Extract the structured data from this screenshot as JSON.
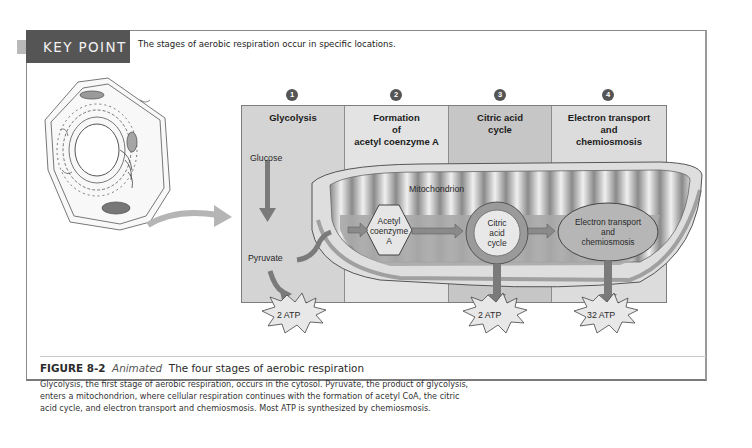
{
  "key_point": {
    "label": "KEY POINT",
    "text": "The stages of aerobic respiration occur in specific locations."
  },
  "diagram": {
    "stages": [
      {
        "number": "1",
        "title_lines": [
          "Glycolysis"
        ]
      },
      {
        "number": "2",
        "title_lines": [
          "Formation",
          "of",
          "acetyl coenzyme A"
        ]
      },
      {
        "number": "3",
        "title_lines": [
          "Citric acid",
          "cycle"
        ]
      },
      {
        "number": "4",
        "title_lines": [
          "Electron transport",
          "and",
          "chemiosmosis"
        ]
      }
    ],
    "labels": {
      "glucose": "Glucose",
      "pyruvate": "Pyruvate",
      "mitochondrion": "Mitochondrion",
      "acetyl_coa": [
        "Acetyl",
        "coenzyme",
        "A"
      ],
      "citric_cycle": [
        "Citric",
        "acid",
        "cycle"
      ],
      "electron_transport": [
        "Electron transport",
        "and",
        "chemiosmosis"
      ]
    },
    "atp_yields": [
      {
        "stage": "Glycolysis",
        "label": "2 ATP"
      },
      {
        "stage": "Citric acid cycle",
        "label": "2 ATP"
      },
      {
        "stage": "Electron transport and chemiosmosis",
        "label": "32 ATP"
      }
    ],
    "colors": {
      "panel_fill": "#d6d6d6",
      "panel_alt_fill": "#e6e6e6",
      "citric_col_fill": "#c8c8c8",
      "arrow": "#7a7a7a",
      "key_band": "#555555"
    }
  },
  "caption": {
    "figure_number": "FIGURE 8-2",
    "tag": "Animated",
    "title": "The four stages of aerobic respiration",
    "lines": [
      "Glycolysis, the first stage of aerobic respiration, occurs in the cytosol. Pyruvate, the product of glycolysis,",
      "enters a mitochondrion, where cellular respiration continues with the formation of acetyl CoA, the citric",
      "acid cycle, and electron transport and chemiosmosis. Most ATP is synthesized by chemiosmosis."
    ]
  }
}
